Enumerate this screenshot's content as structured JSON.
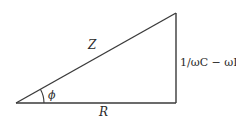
{
  "diagram": {
    "vertices": {
      "origin": [
        16,
        103
      ],
      "right_angle": [
        176,
        103
      ],
      "apex": [
        176,
        13
      ]
    },
    "labels": {
      "hypotenuse": "Z",
      "vertical_side": "1/ωC − ωL",
      "horizontal_side": "R",
      "angle": "ϕ"
    },
    "colors": {
      "line": "#3a3a3a",
      "text": "#2a2a2a",
      "background": "#ffffff"
    }
  }
}
